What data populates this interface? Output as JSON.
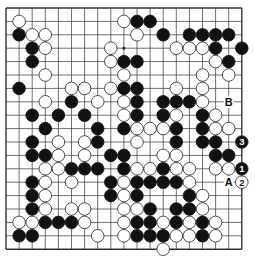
{
  "board": {
    "size": 19,
    "origin_x": 6,
    "origin_y": 8,
    "step_x": 13.1,
    "step_y": 13.4,
    "stone_radius": 6.3,
    "colors": {
      "line": "#333333",
      "black": "#111111",
      "white": "#ffffff",
      "stone_outline": "#222222"
    },
    "hoshi": [
      [
        3,
        3
      ],
      [
        9,
        3
      ],
      [
        15,
        3
      ],
      [
        3,
        9
      ],
      [
        9,
        9
      ],
      [
        15,
        9
      ],
      [
        3,
        15
      ],
      [
        9,
        15
      ],
      [
        15,
        15
      ]
    ],
    "black": [
      [
        10,
        1
      ],
      [
        11,
        1
      ],
      [
        1,
        2
      ],
      [
        12,
        2
      ],
      [
        14,
        2
      ],
      [
        15,
        2
      ],
      [
        16,
        2
      ],
      [
        17,
        2
      ],
      [
        2,
        3
      ],
      [
        16,
        3
      ],
      [
        18,
        3
      ],
      [
        2,
        4
      ],
      [
        9,
        4
      ],
      [
        10,
        4
      ],
      [
        17,
        4
      ],
      [
        1,
        6
      ],
      [
        9,
        6
      ],
      [
        10,
        6
      ],
      [
        5,
        7
      ],
      [
        10,
        7
      ],
      [
        12,
        7
      ],
      [
        13,
        7
      ],
      [
        14,
        7
      ],
      [
        2,
        8
      ],
      [
        4,
        8
      ],
      [
        6,
        8
      ],
      [
        10,
        8
      ],
      [
        12,
        8
      ],
      [
        15,
        8
      ],
      [
        3,
        9
      ],
      [
        7,
        9
      ],
      [
        9,
        9
      ],
      [
        13,
        9
      ],
      [
        15,
        9
      ],
      [
        2,
        10
      ],
      [
        7,
        10
      ],
      [
        13,
        10
      ],
      [
        15,
        10
      ],
      [
        16,
        10
      ],
      [
        2,
        11
      ],
      [
        3,
        11
      ],
      [
        8,
        11
      ],
      [
        9,
        11
      ],
      [
        16,
        11
      ],
      [
        17,
        11
      ],
      [
        5,
        12
      ],
      [
        6,
        12
      ],
      [
        7,
        12
      ],
      [
        9,
        12
      ],
      [
        12,
        12
      ],
      [
        2,
        13
      ],
      [
        8,
        13
      ],
      [
        10,
        13
      ],
      [
        11,
        13
      ],
      [
        12,
        13
      ],
      [
        13,
        13
      ],
      [
        2,
        14
      ],
      [
        8,
        14
      ],
      [
        10,
        14
      ],
      [
        14,
        14
      ],
      [
        2,
        15
      ],
      [
        11,
        15
      ],
      [
        13,
        15
      ],
      [
        14,
        15
      ],
      [
        3,
        16
      ],
      [
        4,
        16
      ],
      [
        5,
        16
      ],
      [
        10,
        16
      ],
      [
        11,
        16
      ],
      [
        13,
        16
      ],
      [
        15,
        16
      ],
      [
        1,
        17
      ],
      [
        2,
        17
      ],
      [
        10,
        17
      ],
      [
        11,
        17
      ],
      [
        12,
        17
      ],
      [
        15,
        17
      ]
    ],
    "white": [
      [
        1,
        1
      ],
      [
        9,
        1
      ],
      [
        2,
        2
      ],
      [
        3,
        2
      ],
      [
        10,
        2
      ],
      [
        3,
        3
      ],
      [
        8,
        3
      ],
      [
        13,
        3
      ],
      [
        14,
        3
      ],
      [
        15,
        3
      ],
      [
        8,
        4
      ],
      [
        16,
        4
      ],
      [
        3,
        5
      ],
      [
        9,
        5
      ],
      [
        15,
        5
      ],
      [
        17,
        5
      ],
      [
        5,
        6
      ],
      [
        6,
        6
      ],
      [
        8,
        6
      ],
      [
        13,
        6
      ],
      [
        15,
        6
      ],
      [
        3,
        7
      ],
      [
        7,
        7
      ],
      [
        9,
        7
      ],
      [
        15,
        7
      ],
      [
        9,
        8
      ],
      [
        13,
        8
      ],
      [
        16,
        8
      ],
      [
        10,
        9
      ],
      [
        11,
        9
      ],
      [
        12,
        9
      ],
      [
        16,
        9
      ],
      [
        17,
        9
      ],
      [
        4,
        10
      ],
      [
        6,
        10
      ],
      [
        10,
        10
      ],
      [
        4,
        11
      ],
      [
        6,
        11
      ],
      [
        12,
        11
      ],
      [
        13,
        11
      ],
      [
        3,
        12
      ],
      [
        4,
        12
      ],
      [
        10,
        12
      ],
      [
        11,
        12
      ],
      [
        13,
        12
      ],
      [
        14,
        12
      ],
      [
        16,
        12
      ],
      [
        17,
        12
      ],
      [
        3,
        13
      ],
      [
        5,
        13
      ],
      [
        9,
        13
      ],
      [
        14,
        13
      ],
      [
        3,
        14
      ],
      [
        9,
        14
      ],
      [
        15,
        14
      ],
      [
        3,
        15
      ],
      [
        5,
        15
      ],
      [
        6,
        15
      ],
      [
        9,
        15
      ],
      [
        10,
        15
      ],
      [
        15,
        15
      ],
      [
        1,
        16
      ],
      [
        2,
        16
      ],
      [
        6,
        16
      ],
      [
        9,
        16
      ],
      [
        12,
        16
      ],
      [
        14,
        16
      ],
      [
        16,
        16
      ],
      [
        7,
        17
      ],
      [
        9,
        17
      ],
      [
        13,
        17
      ],
      [
        14,
        17
      ],
      [
        16,
        17
      ],
      [
        12,
        18
      ]
    ],
    "numbered_moves": [
      {
        "x": 18,
        "y": 12,
        "color": "black",
        "label": "1"
      },
      {
        "x": 18,
        "y": 13,
        "color": "white",
        "label": "2"
      },
      {
        "x": 18,
        "y": 10,
        "color": "black",
        "label": "3"
      }
    ],
    "letter_marks": [
      {
        "x": 17,
        "y": 13,
        "label": "A"
      },
      {
        "x": 17,
        "y": 7,
        "label": "B"
      }
    ]
  }
}
